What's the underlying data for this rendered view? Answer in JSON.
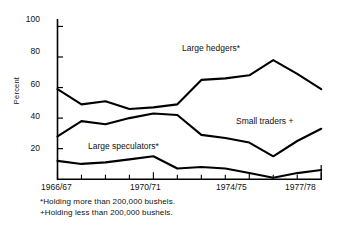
{
  "chart_data": {
    "type": "line",
    "title": "",
    "subtitle": "",
    "xlabel": "",
    "ylabel": "Percent",
    "ylim": [
      0,
      105
    ],
    "yticks": [
      20,
      40,
      60,
      80,
      100
    ],
    "grid": false,
    "legend_position": "inline-annotations",
    "x": [
      "1966/67",
      "1967/68",
      "1968/69",
      "1969/70",
      "1970/71",
      "1971/72",
      "1972/73",
      "1973/74",
      "1974/75",
      "1975/76",
      "1976/77",
      "1977/78"
    ],
    "xtick_labels": [
      "1966/67",
      "1970/71",
      "1974/75",
      "1977/78"
    ],
    "xtick_label_index": [
      0,
      4,
      8,
      11
    ],
    "series": [
      {
        "name": "Large hedgers*",
        "values": [
          59,
          49,
          51,
          46,
          47,
          49,
          65,
          66,
          68,
          78,
          69,
          59
        ]
      },
      {
        "name": "Small traders +",
        "values": [
          28,
          38,
          36,
          40,
          43,
          42,
          29,
          27,
          24,
          15,
          25,
          33
        ]
      },
      {
        "name": "Large speculators*",
        "values": [
          12,
          10,
          11,
          13,
          15,
          7,
          8,
          7,
          4,
          1,
          4,
          6
        ]
      }
    ],
    "annotations": [
      {
        "text": "Large hedgers*",
        "x": 0.53,
        "y": 0.23
      },
      {
        "text": "Small traders +",
        "x": 0.7,
        "y": 0.53
      },
      {
        "text": "Large speculators*",
        "x": 0.25,
        "y": 0.64
      }
    ],
    "footnotes": [
      "*Holding more than 200,000 bushels.",
      "+Holding less than 200,000 bushels."
    ],
    "colors": {
      "line": "#000000",
      "axis": "#000000",
      "background": "#ffffff"
    }
  }
}
